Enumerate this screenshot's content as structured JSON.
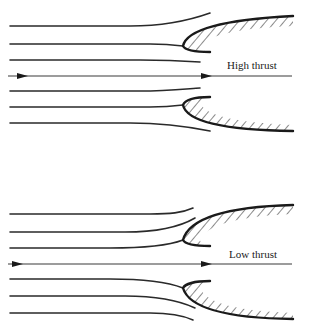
{
  "figure": {
    "panels": [
      {
        "id": "high-thrust",
        "label": "High thrust",
        "streamlines_upper": 3,
        "streamlines_lower": 3,
        "flow_direction": "left-to-right"
      },
      {
        "id": "low-thrust",
        "label": "Low thrust",
        "streamlines_upper": 3,
        "streamlines_lower": 3,
        "flow_direction": "left-to-right"
      }
    ],
    "colors": {
      "line": "#1a1a1a",
      "background": "#ffffff"
    }
  }
}
